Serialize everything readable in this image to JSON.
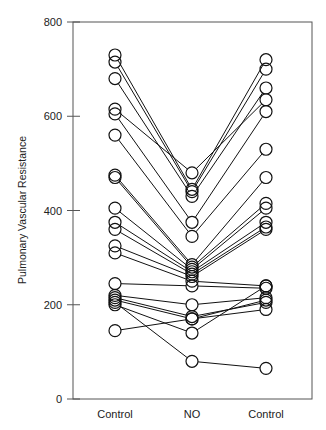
{
  "chart_data": {
    "type": "line",
    "subtype": "paired-before-after",
    "title": "",
    "xlabel": "",
    "ylabel": "Pulmonary Vascular Resistance",
    "categories": [
      "Control",
      "NO",
      "Control"
    ],
    "ylim": [
      0,
      800
    ],
    "yticks": [
      0,
      200,
      400,
      600,
      800
    ],
    "grid": false,
    "legend": null,
    "marker": "open-circle",
    "series": [
      {
        "name": "subject-1",
        "values": [
          730,
          445,
          720
        ]
      },
      {
        "name": "subject-2",
        "values": [
          715,
          440,
          700
        ]
      },
      {
        "name": "subject-3",
        "values": [
          680,
          430,
          660
        ]
      },
      {
        "name": "subject-4",
        "values": [
          615,
          480,
          635
        ]
      },
      {
        "name": "subject-5",
        "values": [
          605,
          375,
          610
        ]
      },
      {
        "name": "subject-6",
        "values": [
          560,
          345,
          530
        ]
      },
      {
        "name": "subject-7",
        "values": [
          475,
          285,
          470
        ]
      },
      {
        "name": "subject-8",
        "values": [
          470,
          280,
          415
        ]
      },
      {
        "name": "subject-9",
        "values": [
          405,
          275,
          405
        ]
      },
      {
        "name": "subject-10",
        "values": [
          375,
          270,
          375
        ]
      },
      {
        "name": "subject-11",
        "values": [
          360,
          265,
          365
        ]
      },
      {
        "name": "subject-12",
        "values": [
          325,
          260,
          360
        ]
      },
      {
        "name": "subject-13",
        "values": [
          310,
          250,
          240
        ]
      },
      {
        "name": "subject-14",
        "values": [
          245,
          240,
          235
        ]
      },
      {
        "name": "subject-15",
        "values": [
          220,
          200,
          215
        ]
      },
      {
        "name": "subject-16",
        "values": [
          215,
          175,
          205
        ]
      },
      {
        "name": "subject-17",
        "values": [
          210,
          170,
          190
        ]
      },
      {
        "name": "subject-18",
        "values": [
          200,
          140,
          240
        ]
      },
      {
        "name": "subject-19",
        "values": [
          145,
          170,
          210
        ]
      },
      {
        "name": "subject-20",
        "values": [
          205,
          80,
          65
        ]
      }
    ]
  },
  "axis": {
    "ytick_labels": [
      "0",
      "200",
      "400",
      "600",
      "800"
    ],
    "xtick_labels": [
      "Control",
      "NO",
      "Control"
    ],
    "ylabel": "Pulmonary Vascular Resistance"
  }
}
